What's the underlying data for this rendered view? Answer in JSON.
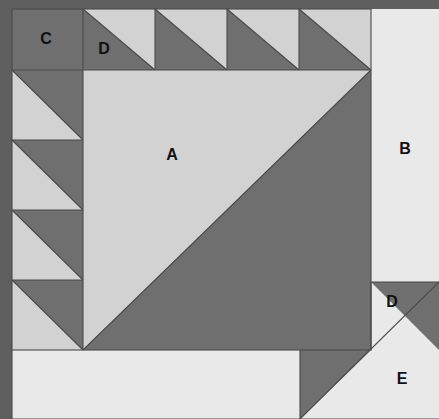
{
  "figure": {
    "type": "quilt-block-piecing-diagram",
    "title": "",
    "width": 439,
    "height": 419
  },
  "colors": {
    "dark_gray": "#706F70",
    "medium_gray": "#8C8C8C",
    "light_gray": "#D2D2D2",
    "background_light": "#E9E9E9",
    "outer_background": "#F2F2F2",
    "outline": "#4A4A4A",
    "label_text": "#111111",
    "edge_dark": "#5F5F5F"
  },
  "labels": [
    {
      "id": "label-a",
      "text": "A",
      "x": 172,
      "y": 156
    },
    {
      "id": "label-b",
      "text": "B",
      "x": 405,
      "y": 150
    },
    {
      "id": "label-c",
      "text": "C",
      "x": 46,
      "y": 40
    },
    {
      "id": "label-d-top",
      "text": "D",
      "x": 104,
      "y": 50
    },
    {
      "id": "label-d-bottom",
      "text": "D",
      "x": 392,
      "y": 303
    },
    {
      "id": "label-e",
      "text": "E",
      "x": 402,
      "y": 380
    }
  ],
  "geometry": {
    "block": {
      "left": 12,
      "top": 9,
      "right": 371,
      "bottom": 350,
      "cell": 72
    },
    "top_row": {
      "corner_square_c": {
        "x": 12,
        "y": 9,
        "w": 71,
        "h": 61
      },
      "triangle_count": 4,
      "triangle_cells": [
        {
          "x": 83,
          "y": 9,
          "w": 72,
          "h": 61
        },
        {
          "x": 155,
          "y": 9,
          "w": 72,
          "h": 61
        },
        {
          "x": 227,
          "y": 9,
          "w": 72,
          "h": 61
        },
        {
          "x": 299,
          "y": 9,
          "w": 72,
          "h": 61
        }
      ]
    },
    "left_column": {
      "triangle_count": 4,
      "triangle_cells": [
        {
          "x": 12,
          "y": 70,
          "w": 71,
          "h": 70
        },
        {
          "x": 12,
          "y": 140,
          "w": 71,
          "h": 70
        },
        {
          "x": 12,
          "y": 210,
          "w": 71,
          "h": 70
        },
        {
          "x": 12,
          "y": 280,
          "w": 71,
          "h": 70
        }
      ]
    },
    "center_square_a": {
      "x": 83,
      "y": 70,
      "w": 288,
      "h": 280
    },
    "right_panel_b": {
      "x": 371,
      "y": 9,
      "w": 68,
      "h": 341
    },
    "bottom_panel_e": {
      "x": 12,
      "y": 350,
      "w": 427,
      "h": 69
    },
    "bottom_right_d_triangle": {
      "p1": [
        371,
        282
      ],
      "p2": [
        439,
        282
      ],
      "p3": [
        439,
        350
      ]
    },
    "bottom_dark_triangle": {
      "p1": [
        300,
        350
      ],
      "p2": [
        371,
        350
      ],
      "p3": [
        300,
        419
      ]
    }
  }
}
